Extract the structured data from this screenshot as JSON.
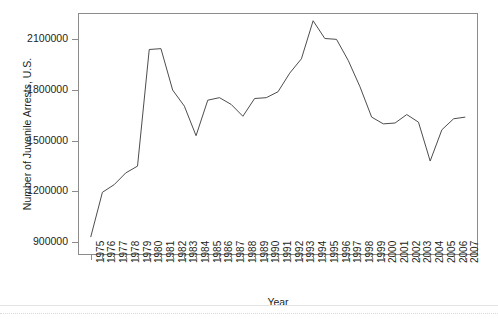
{
  "chart_data": {
    "type": "line",
    "title": "",
    "xlabel": "Year",
    "ylabel": "Number of Juvenile Arrests, U.S.",
    "grid": false,
    "legend": false,
    "xlim": [
      1974.0,
      2008.0
    ],
    "ylim": [
      830000,
      2250000
    ],
    "ytick_values": [
      900000,
      1200000,
      1500000,
      1800000,
      2100000
    ],
    "ytick_labels": [
      "900000",
      "1200000",
      "1500000",
      "1800000",
      "2100000"
    ],
    "categories": [
      "1975",
      "1976",
      "1977",
      "1978",
      "1979",
      "1980",
      "1981",
      "1982",
      "1983",
      "1984",
      "1985",
      "1986",
      "1987",
      "1988",
      "1989",
      "1990",
      "1991",
      "1992",
      "1993",
      "1994",
      "1995",
      "1996",
      "1997",
      "1998",
      "1999",
      "2000",
      "2001",
      "2002",
      "2003",
      "2004",
      "2005",
      "2006",
      "2007"
    ],
    "x": [
      1975,
      1976,
      1977,
      1978,
      1979,
      1980,
      1981,
      1982,
      1983,
      1984,
      1985,
      1986,
      1987,
      1988,
      1989,
      1990,
      1991,
      1992,
      1993,
      1994,
      1995,
      1996,
      1997,
      1998,
      1999,
      2000,
      2001,
      2002,
      2003,
      2004,
      2005,
      2006,
      2007
    ],
    "values": [
      930000,
      1195000,
      1240000,
      1310000,
      1350000,
      2040000,
      2045000,
      1800000,
      1705000,
      1530000,
      1740000,
      1755000,
      1715000,
      1645000,
      1750000,
      1755000,
      1790000,
      1900000,
      1985000,
      2210000,
      2105000,
      2100000,
      1975000,
      1820000,
      1640000,
      1600000,
      1605000,
      1655000,
      1610000,
      1380000,
      1565000,
      1630000,
      1640000
    ],
    "series": [
      {
        "name": "Number of Juvenile Arrests, U.S.",
        "color": "#4d4d4d",
        "values": [
          930000,
          1195000,
          1240000,
          1310000,
          1350000,
          2040000,
          2045000,
          1800000,
          1705000,
          1530000,
          1740000,
          1755000,
          1715000,
          1645000,
          1750000,
          1755000,
          1790000,
          1900000,
          1985000,
          2210000,
          2105000,
          2100000,
          1975000,
          1820000,
          1640000,
          1600000,
          1605000,
          1655000,
          1610000,
          1380000,
          1565000,
          1630000,
          1640000
        ]
      }
    ],
    "annotations": []
  },
  "axes": {
    "y_title": "Number of Juvenile Arrests, U.S.",
    "x_title": "Year"
  },
  "colors": {
    "line": "#4d4d4d",
    "frame": "#8c8c8c",
    "text": "#231f20",
    "background": "#ffffff"
  }
}
